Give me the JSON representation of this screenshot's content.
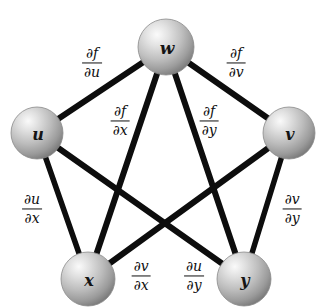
{
  "figure": {
    "background_color": "#ffffff",
    "edge_color": "#0d0d0d",
    "node_fill_light": "#f2f2f2",
    "node_fill_mid": "#b9b9b9",
    "node_fill_dark": "#6f6f6f",
    "label_color": "#0f0f0f"
  },
  "nodes": [
    {
      "id": "w",
      "label": "w",
      "cx": 166,
      "cy": 47,
      "r": 28
    },
    {
      "id": "u",
      "label": "u",
      "cx": 37,
      "cy": 133,
      "r": 26
    },
    {
      "id": "v",
      "label": "v",
      "cx": 289,
      "cy": 133,
      "r": 26
    },
    {
      "id": "x",
      "label": "x",
      "cx": 88,
      "cy": 279,
      "r": 27
    },
    {
      "id": "y",
      "label": "y",
      "cx": 244,
      "cy": 279,
      "r": 27
    }
  ],
  "edges": [
    {
      "id": "w-u",
      "from": "w",
      "to": "u",
      "label_num": "∂f",
      "label_den": "∂u",
      "label_x": 92,
      "label_y": 63
    },
    {
      "id": "w-v",
      "from": "w",
      "to": "v",
      "label_num": "∂f",
      "label_den": "∂v",
      "label_x": 236,
      "label_y": 63
    },
    {
      "id": "w-x",
      "from": "w",
      "to": "x",
      "label_num": "∂f",
      "label_den": "∂x",
      "label_x": 120,
      "label_y": 121
    },
    {
      "id": "w-y",
      "from": "w",
      "to": "y",
      "label_num": "∂f",
      "label_den": "∂y",
      "label_x": 209,
      "label_y": 121
    },
    {
      "id": "u-x",
      "from": "u",
      "to": "x",
      "label_num": "∂u",
      "label_den": "∂x",
      "label_x": 32,
      "label_y": 209
    },
    {
      "id": "v-y",
      "from": "v",
      "to": "y",
      "label_num": "∂v",
      "label_den": "∂y",
      "label_x": 292,
      "label_y": 209
    },
    {
      "id": "v-x",
      "from": "v",
      "to": "x",
      "label_num": "∂v",
      "label_den": "∂x",
      "label_x": 141,
      "label_y": 276
    },
    {
      "id": "u-y",
      "from": "u",
      "to": "y",
      "label_num": "∂u",
      "label_den": "∂y",
      "label_x": 194,
      "label_y": 276
    }
  ]
}
